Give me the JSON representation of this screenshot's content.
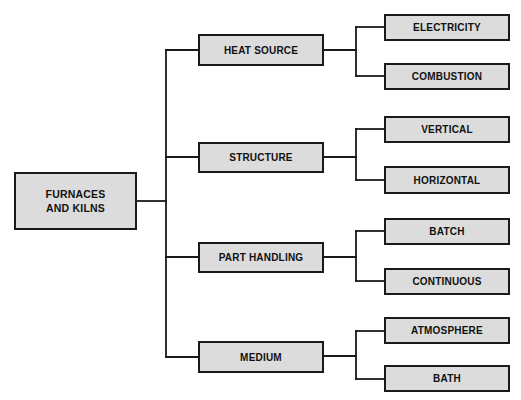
{
  "diagram": {
    "type": "tree",
    "colors": {
      "box_fill": "#dcdcdc",
      "box_border": "#1a1a1a",
      "line": "#1a1a1a",
      "text": "#111111",
      "background": "#ffffff"
    },
    "root": {
      "label_line1": "FURNACES",
      "label_line2": "AND KILNS"
    },
    "categories": [
      {
        "label": "HEAT SOURCE",
        "children": [
          {
            "label": "ELECTRICITY"
          },
          {
            "label": "COMBUSTION"
          }
        ]
      },
      {
        "label": "STRUCTURE",
        "children": [
          {
            "label": "VERTICAL"
          },
          {
            "label": "HORIZONTAL"
          }
        ]
      },
      {
        "label": "PART HANDLING",
        "children": [
          {
            "label": "BATCH"
          },
          {
            "label": "CONTINUOUS"
          }
        ]
      },
      {
        "label": "MEDIUM",
        "children": [
          {
            "label": "ATMOSPHERE"
          },
          {
            "label": "BATH"
          }
        ]
      }
    ]
  }
}
